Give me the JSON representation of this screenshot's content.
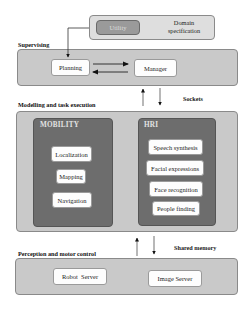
{
  "top": {
    "utility_label": "Utility",
    "domain_spec_line1": "Domain",
    "domain_spec_line2": "specification"
  },
  "layers": {
    "supervising": {
      "label": "Supervising",
      "nodes": [
        "Planning",
        "Manager"
      ]
    },
    "modelling": {
      "label": "Modelling and task execution",
      "modules": [
        {
          "title": "MOBILITY",
          "nodes": [
            "Localization",
            "Mapping",
            "Navigation"
          ]
        },
        {
          "title": "HRI",
          "nodes": [
            "Speech synthesis",
            "Facial expressions",
            "Face recognition",
            "People finding"
          ]
        }
      ]
    },
    "perception": {
      "label": "Perception and motor control",
      "nodes": [
        "Robot  Server",
        "Image Server"
      ]
    }
  },
  "links": {
    "sockets": "Sockets",
    "shared_memory": "Shared memory"
  },
  "colors": {
    "panel": "#c9c9c9",
    "module": "#6d6d6d",
    "node": "#fdfdfd",
    "utility": "#9a9a9a"
  }
}
